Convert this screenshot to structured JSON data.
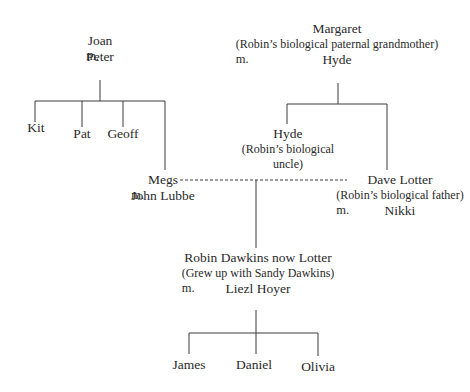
{
  "family_tree": {
    "joan_couple": {
      "name": "Joan",
      "marriage": "m.",
      "spouse": "Peter"
    },
    "joan_children": [
      "Kit",
      "Pat",
      "Geoff"
    ],
    "megs_couple": {
      "name": "Megs",
      "marriage": "m.",
      "spouse": "John Lubbe"
    },
    "margaret_couple": {
      "name": "Margaret",
      "note": "(Robin’s biological paternal grandmother)",
      "marriage": "m.",
      "spouse": "Hyde"
    },
    "hyde_son": {
      "name": "Hyde",
      "note_line1": "(Robin’s biological",
      "note_line2": "uncle)"
    },
    "dave_couple": {
      "name": "Dave Lotter",
      "note": "(Robin’s biological father)",
      "marriage": "m.",
      "spouse": "Nikki"
    },
    "robin_couple": {
      "name": "Robin Dawkins now Lotter",
      "note": "(Grew up with Sandy Dawkins)",
      "marriage": "m.",
      "spouse": "Liezl Hoyer"
    },
    "robin_children": [
      "James",
      "Daniel",
      "Olivia"
    ]
  }
}
